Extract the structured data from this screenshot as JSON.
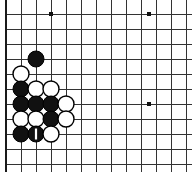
{
  "figure": {
    "kind": "go-board-diagram",
    "width": 192,
    "height": 172
  },
  "board": {
    "orientation": "bottom-left-corner",
    "line_color": "#333333",
    "thick_edge_color": "#1a1a1a",
    "background_color": "#ffffff",
    "grid_spacing": 15,
    "origin_x": 6,
    "origin_y": 14,
    "columns": 13,
    "rows": 11,
    "left_edge_thick": true,
    "bottom_edge_thick": true,
    "top_edge_visible": false,
    "right_edge_visible": false,
    "star_points": [
      {
        "col": 4,
        "row": 1,
        "x": 51,
        "y": 14
      },
      {
        "col": 10,
        "row": 1,
        "x": 149,
        "y": 14
      },
      {
        "col": 10,
        "row": 7,
        "x": 149,
        "y": 104
      }
    ]
  },
  "stones": [
    {
      "color": "black",
      "col": 3,
      "row": 4,
      "x": 36,
      "y": 59,
      "marked": false,
      "label": "black-stone-c3r4"
    },
    {
      "color": "white",
      "col": 2,
      "row": 5,
      "x": 21,
      "y": 74,
      "marked": false,
      "label": "white-stone-c2r5"
    },
    {
      "color": "black",
      "col": 2,
      "row": 6,
      "x": 21,
      "y": 89,
      "marked": false,
      "label": "black-stone-c2r6"
    },
    {
      "color": "white",
      "col": 3,
      "row": 6,
      "x": 36,
      "y": 89,
      "marked": false,
      "label": "white-stone-c3r6"
    },
    {
      "color": "white",
      "col": 4,
      "row": 6,
      "x": 51,
      "y": 89,
      "marked": false,
      "label": "white-stone-c4r6"
    },
    {
      "color": "black",
      "col": 2,
      "row": 7,
      "x": 21,
      "y": 104,
      "marked": false,
      "label": "black-stone-c2r7"
    },
    {
      "color": "black",
      "col": 3,
      "row": 7,
      "x": 36,
      "y": 104,
      "marked": false,
      "label": "black-stone-c3r7"
    },
    {
      "color": "black",
      "col": 4,
      "row": 7,
      "x": 51,
      "y": 104,
      "marked": false,
      "label": "black-stone-c4r7"
    },
    {
      "color": "white",
      "col": 5,
      "row": 7,
      "x": 66,
      "y": 104,
      "marked": false,
      "label": "white-stone-c5r7"
    },
    {
      "color": "white",
      "col": 2,
      "row": 8,
      "x": 21,
      "y": 119,
      "marked": false,
      "label": "white-stone-c2r8"
    },
    {
      "color": "white",
      "col": 3,
      "row": 8,
      "x": 36,
      "y": 119,
      "marked": false,
      "label": "white-stone-c3r8"
    },
    {
      "color": "black",
      "col": 4,
      "row": 8,
      "x": 51,
      "y": 119,
      "marked": false,
      "label": "black-stone-c4r8"
    },
    {
      "color": "white",
      "col": 5,
      "row": 8,
      "x": 66,
      "y": 119,
      "marked": false,
      "label": "white-stone-c5r8"
    },
    {
      "color": "black",
      "col": 2,
      "row": 9,
      "x": 21,
      "y": 134,
      "marked": false,
      "label": "black-stone-c2r9"
    },
    {
      "color": "black",
      "col": 3,
      "row": 9,
      "x": 36,
      "y": 134,
      "marked": true,
      "label": "black-stone-marked-c3r9"
    },
    {
      "color": "white",
      "col": 4,
      "row": 9,
      "x": 51,
      "y": 134,
      "marked": false,
      "label": "white-stone-c4r9"
    }
  ],
  "stone_style": {
    "radius": 8,
    "black_fill": "#111111",
    "white_fill": "#ffffff",
    "stone_outline": "#000000",
    "mark_color_on_black": "#ffffff",
    "mark_width": 2.2,
    "mark_height": 11
  }
}
